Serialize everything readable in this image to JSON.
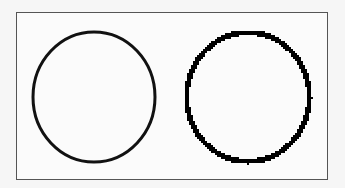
{
  "figure": {
    "frame": {
      "x": 16,
      "y": 12,
      "width": 312,
      "height": 168,
      "border_color": "#555555"
    },
    "circles": [
      {
        "name": "anti-aliased-circle",
        "cx": 94,
        "cy": 97,
        "rx": 61,
        "ry": 65,
        "stroke_width": 3,
        "stroke": "#111111",
        "rendering": "smooth"
      },
      {
        "name": "aliased-circle",
        "cx": 248,
        "cy": 97,
        "rx": 62,
        "ry": 65,
        "stroke_width": 4,
        "stroke": "#000000",
        "rendering": "pixelated"
      }
    ]
  }
}
